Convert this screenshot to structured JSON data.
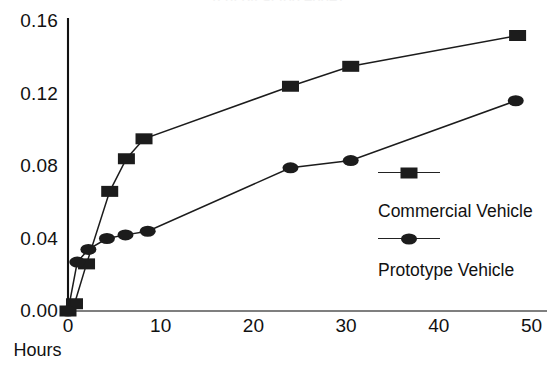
{
  "chart_data": {
    "type": "line",
    "title": "(cut off at top edge)",
    "xlabel": "Hours",
    "ylabel": "",
    "xlim": [
      -1,
      52
    ],
    "ylim": [
      0.0,
      0.16
    ],
    "xticks": [
      "0",
      "10",
      "20",
      "30",
      "40",
      "50"
    ],
    "xtick_values": [
      0,
      10,
      20,
      30,
      40,
      50
    ],
    "yticks": [
      "0.00",
      "0.04",
      "0.08",
      "0.12",
      "0.16"
    ],
    "ytick_values": [
      0.0,
      0.04,
      0.08,
      0.12,
      0.16
    ],
    "grid": false,
    "legend_position": "center-right",
    "series": [
      {
        "name": "Commercial Vehicle",
        "marker": "square",
        "color": "#1c1c1c",
        "x": [
          0,
          0.7,
          2.0,
          4.5,
          6.3,
          8.2,
          24.0,
          30.5,
          48.5
        ],
        "y": [
          0.0,
          0.004,
          0.026,
          0.066,
          0.084,
          0.095,
          0.124,
          0.135,
          0.152
        ]
      },
      {
        "name": "Prototype Vehicle",
        "marker": "circle",
        "color": "#1c1c1c",
        "x": [
          0,
          1.0,
          2.2,
          4.2,
          6.2,
          8.6,
          24.0,
          30.5,
          48.3
        ],
        "y": [
          0.0,
          0.027,
          0.034,
          0.04,
          0.042,
          0.044,
          0.079,
          0.083,
          0.116
        ]
      }
    ]
  },
  "axes": {
    "y_tick_labels": [
      "0.16",
      "0.12",
      "0.08",
      "0.04",
      "0.00"
    ],
    "x_tick_labels": [
      "0",
      "10",
      "20",
      "30",
      "40",
      "50"
    ],
    "x_axis_title": "Hours"
  },
  "legend": {
    "entries": [
      {
        "label": "Commercial Vehicle",
        "marker": "square-marker"
      },
      {
        "label": "Prototype Vehicle",
        "marker": "circle-marker"
      }
    ]
  }
}
